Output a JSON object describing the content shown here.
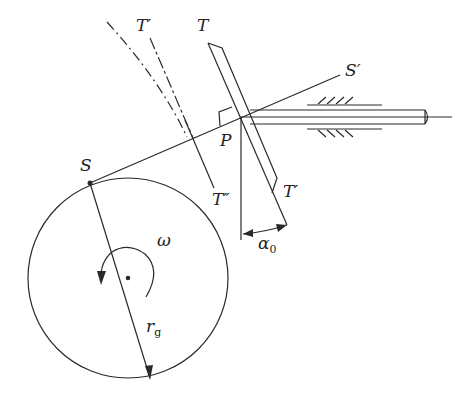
{
  "diagram": {
    "type": "mechanism",
    "labels": {
      "T_top": "T",
      "T_prime_top": "T′",
      "S_prime": "S′",
      "P": "P",
      "S": "S",
      "T_double_prime": "T″",
      "T_prime_bottom": "T′",
      "omega": "ω",
      "alpha": "α",
      "alpha_sub": "0",
      "r": "r",
      "r_sub": "g"
    },
    "colors": {
      "stroke": "#2a2a2a",
      "background": "#ffffff"
    }
  }
}
